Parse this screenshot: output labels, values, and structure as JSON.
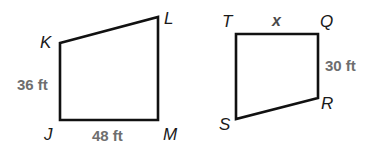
{
  "figures": [
    {
      "name": "JKLM",
      "vertices": {
        "K": {
          "label": "K",
          "x": 60,
          "y": 43
        },
        "L": {
          "label": "L",
          "x": 158,
          "y": 17
        },
        "M": {
          "label": "M",
          "x": 158,
          "y": 120
        },
        "J": {
          "label": "J",
          "x": 60,
          "y": 120
        }
      },
      "measurements": {
        "JK": "36 ft",
        "JM": "48 ft"
      }
    },
    {
      "name": "QRST",
      "vertices": {
        "T": {
          "label": "T",
          "x": 236,
          "y": 34
        },
        "Q": {
          "label": "Q",
          "x": 318,
          "y": 34
        },
        "R": {
          "label": "R",
          "x": 318,
          "y": 98
        },
        "S": {
          "label": "S",
          "x": 236,
          "y": 119
        }
      },
      "measurements": {
        "TQ": "x",
        "QR": "30 ft"
      }
    }
  ],
  "colors": {
    "stroke": "#111111",
    "measure_text": "#6e6e6e",
    "vertex_text": "#1a1a1a"
  }
}
